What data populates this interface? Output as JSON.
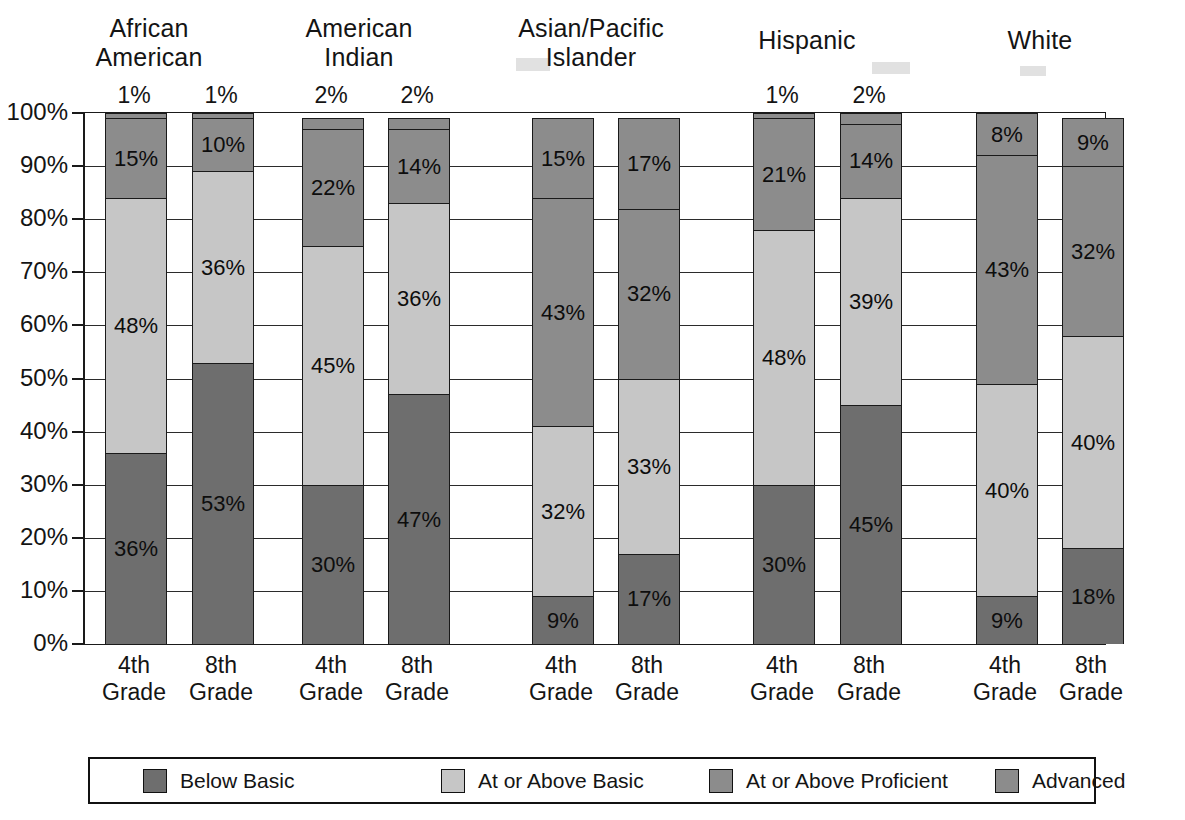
{
  "chart_data": {
    "type": "bar",
    "subtype": "stacked-column-100",
    "title": "",
    "xlabel": "",
    "ylabel": "",
    "ylim": [
      0,
      100
    ],
    "ytick_labels": [
      "100%",
      "90%",
      "80%",
      "70%",
      "60%",
      "50%",
      "40%",
      "30%",
      "20%",
      "10%",
      "0%"
    ],
    "ytick_values": [
      100,
      90,
      80,
      70,
      60,
      50,
      40,
      30,
      20,
      10,
      0
    ],
    "grid": true,
    "legend_position": "bottom",
    "legend": [
      "Below Basic",
      "At or Above Basic",
      "At or Above Proficient",
      "Advanced"
    ],
    "series_colors": [
      "#6e6e6e",
      "#c4c4c4",
      "#8f8f8f",
      "#8f8f8f"
    ],
    "groups": [
      "African American",
      "American Indian",
      "Asian/Pacific Islander",
      "Hispanic",
      "White"
    ],
    "categories": [
      "4th Grade",
      "8th Grade",
      "4th Grade",
      "8th Grade",
      "4th Grade",
      "8th Grade",
      "4th Grade",
      "8th Grade",
      "4th Grade",
      "8th Grade"
    ],
    "series": [
      {
        "name": "Below Basic",
        "values": [
          36,
          53,
          30,
          47,
          9,
          17,
          30,
          45,
          9,
          18
        ]
      },
      {
        "name": "At or Above Basic",
        "values": [
          48,
          36,
          45,
          36,
          32,
          33,
          48,
          39,
          40,
          40
        ]
      },
      {
        "name": "At or Above Proficient",
        "values": [
          15,
          10,
          22,
          14,
          43,
          32,
          21,
          14,
          43,
          32
        ]
      },
      {
        "name": "Advanced",
        "values": [
          1,
          1,
          2,
          2,
          1,
          1,
          1,
          2,
          1,
          1
        ]
      }
    ],
    "bar_labels": [
      {
        "below_basic": "36%",
        "at_or_above_basic": "48%",
        "at_or_above_proficient": "15%",
        "advanced": "1%"
      },
      {
        "below_basic": "53%",
        "at_or_above_basic": "36%",
        "at_or_above_proficient": "10%",
        "advanced": "1%"
      },
      {
        "below_basic": "30%",
        "at_or_above_basic": "45%",
        "at_or_above_proficient": "22%",
        "advanced": "2%"
      },
      {
        "below_basic": "47%",
        "at_or_above_basic": "36%",
        "at_or_above_proficient": "14%",
        "advanced": "2%"
      },
      {
        "below_basic": "9%",
        "at_or_above_basic": "32%",
        "at_or_above_proficient": "15%",
        "advanced": ""
      },
      {
        "below_basic": "17%",
        "at_or_above_basic": "33%",
        "at_or_above_proficient": "17%",
        "advanced": ""
      },
      {
        "below_basic": "30%",
        "at_or_above_basic": "48%",
        "at_or_above_proficient": "21%",
        "advanced": "1%"
      },
      {
        "below_basic": "45%",
        "at_or_above_basic": "39%",
        "at_or_above_proficient": "14%",
        "advanced": "2%"
      },
      {
        "below_basic": "9%",
        "at_or_above_basic": "40%",
        "at_or_above_proficient": "43%",
        "advanced": ""
      },
      {
        "below_basic": "18%",
        "at_or_above_basic": "40%",
        "at_or_above_proficient": "32%",
        "advanced": ""
      }
    ],
    "inner_labels_asian_pacific": {
      "bar1_proficient": "43%",
      "bar2_proficient": "32%"
    }
  },
  "groups": [
    {
      "label": "African\nAmerican"
    },
    {
      "label": "American\nIndian"
    },
    {
      "label": "Asian/Pacific\nIslander"
    },
    {
      "label": "Hispanic"
    },
    {
      "label": "White"
    }
  ],
  "yaxis": {
    "ticks": [
      {
        "label": "100%",
        "value": 100
      },
      {
        "label": "90%",
        "value": 90
      },
      {
        "label": "80%",
        "value": 80
      },
      {
        "label": "70%",
        "value": 70
      },
      {
        "label": "60%",
        "value": 60
      },
      {
        "label": "50%",
        "value": 50
      },
      {
        "label": "40%",
        "value": 40
      },
      {
        "label": "30%",
        "value": 30
      },
      {
        "label": "20%",
        "value": 20
      },
      {
        "label": "10%",
        "value": 10
      },
      {
        "label": "0%",
        "value": 0
      }
    ]
  },
  "xaxis": {
    "labels": [
      {
        "label": "4th\nGrade"
      },
      {
        "label": "8th\nGrade"
      },
      {
        "label": "4th\nGrade"
      },
      {
        "label": "8th\nGrade"
      },
      {
        "label": "4th\nGrade"
      },
      {
        "label": "8th\nGrade"
      },
      {
        "label": "4th\nGrade"
      },
      {
        "label": "8th\nGrade"
      },
      {
        "label": "4th\nGrade"
      },
      {
        "label": "8th\nGrade"
      }
    ]
  },
  "bars": [
    {
      "top_label": "1%",
      "segments": [
        {
          "key": "below_basic",
          "label": "36%",
          "value": 36,
          "color": "#6e6e6e"
        },
        {
          "key": "at_or_above_basic",
          "label": "48%",
          "value": 48,
          "color": "#c6c6c6"
        },
        {
          "key": "at_or_above_proficient",
          "label": "15%",
          "value": 15,
          "color": "#8c8c8c"
        },
        {
          "key": "advanced",
          "label": "",
          "value": 1,
          "color": "#8c8c8c"
        }
      ]
    },
    {
      "top_label": "1%",
      "segments": [
        {
          "key": "below_basic",
          "label": "53%",
          "value": 53,
          "color": "#6e6e6e"
        },
        {
          "key": "at_or_above_basic",
          "label": "36%",
          "value": 36,
          "color": "#c6c6c6"
        },
        {
          "key": "at_or_above_proficient",
          "label": "10%",
          "value": 10,
          "color": "#8c8c8c"
        },
        {
          "key": "advanced",
          "label": "",
          "value": 1,
          "color": "#8c8c8c"
        }
      ]
    },
    {
      "top_label": "2%",
      "segments": [
        {
          "key": "below_basic",
          "label": "30%",
          "value": 30,
          "color": "#6e6e6e"
        },
        {
          "key": "at_or_above_basic",
          "label": "45%",
          "value": 45,
          "color": "#c6c6c6"
        },
        {
          "key": "at_or_above_proficient",
          "label": "22%",
          "value": 22,
          "color": "#8c8c8c"
        },
        {
          "key": "advanced",
          "label": "",
          "value": 2,
          "color": "#8c8c8c"
        }
      ]
    },
    {
      "top_label": "2%",
      "segments": [
        {
          "key": "below_basic",
          "label": "47%",
          "value": 47,
          "color": "#6e6e6e"
        },
        {
          "key": "at_or_above_basic",
          "label": "36%",
          "value": 36,
          "color": "#c6c6c6"
        },
        {
          "key": "at_or_above_proficient",
          "label": "14%",
          "value": 14,
          "color": "#8c8c8c"
        },
        {
          "key": "advanced",
          "label": "",
          "value": 2,
          "color": "#8c8c8c"
        }
      ]
    },
    {
      "top_label": "",
      "segments": [
        {
          "key": "below_basic",
          "label": "9%",
          "value": 9,
          "color": "#6e6e6e"
        },
        {
          "key": "at_or_above_basic",
          "label": "32%",
          "value": 32,
          "color": "#c6c6c6"
        },
        {
          "key": "at_or_above_proficient",
          "label": "43%",
          "value": 43,
          "color": "#8c8c8c"
        },
        {
          "key": "advanced",
          "label": "15%",
          "value": 15,
          "color": "#8c8c8c"
        }
      ]
    },
    {
      "top_label": "",
      "segments": [
        {
          "key": "below_basic",
          "label": "17%",
          "value": 17,
          "color": "#6e6e6e"
        },
        {
          "key": "at_or_above_basic",
          "label": "33%",
          "value": 33,
          "color": "#c6c6c6"
        },
        {
          "key": "at_or_above_proficient",
          "label": "32%",
          "value": 32,
          "color": "#8c8c8c"
        },
        {
          "key": "advanced",
          "label": "17%",
          "value": 17,
          "color": "#8c8c8c"
        }
      ]
    },
    {
      "top_label": "1%",
      "segments": [
        {
          "key": "below_basic",
          "label": "30%",
          "value": 30,
          "color": "#6e6e6e"
        },
        {
          "key": "at_or_above_basic",
          "label": "48%",
          "value": 48,
          "color": "#c6c6c6"
        },
        {
          "key": "at_or_above_proficient",
          "label": "21%",
          "value": 21,
          "color": "#8c8c8c"
        },
        {
          "key": "advanced",
          "label": "",
          "value": 1,
          "color": "#8c8c8c"
        }
      ]
    },
    {
      "top_label": "2%",
      "segments": [
        {
          "key": "below_basic",
          "label": "45%",
          "value": 45,
          "color": "#6e6e6e"
        },
        {
          "key": "at_or_above_basic",
          "label": "39%",
          "value": 39,
          "color": "#c6c6c6"
        },
        {
          "key": "at_or_above_proficient",
          "label": "14%",
          "value": 14,
          "color": "#8c8c8c"
        },
        {
          "key": "advanced",
          "label": "",
          "value": 2,
          "color": "#8c8c8c"
        }
      ]
    },
    {
      "top_label": "",
      "segments": [
        {
          "key": "below_basic",
          "label": "9%",
          "value": 9,
          "color": "#6e6e6e"
        },
        {
          "key": "at_or_above_basic",
          "label": "40%",
          "value": 40,
          "color": "#c6c6c6"
        },
        {
          "key": "at_or_above_proficient",
          "label": "43%",
          "value": 43,
          "color": "#8c8c8c"
        },
        {
          "key": "advanced",
          "label": "8%",
          "value": 8,
          "color": "#8c8c8c"
        }
      ]
    },
    {
      "top_label": "",
      "segments": [
        {
          "key": "below_basic",
          "label": "18%",
          "value": 18,
          "color": "#6e6e6e"
        },
        {
          "key": "at_or_above_basic",
          "label": "40%",
          "value": 40,
          "color": "#c6c6c6"
        },
        {
          "key": "at_or_above_proficient",
          "label": "32%",
          "value": 32,
          "color": "#8c8c8c"
        },
        {
          "key": "advanced",
          "label": "9%",
          "value": 9,
          "color": "#8c8c8c"
        }
      ]
    }
  ],
  "legend": {
    "items": [
      {
        "label": "Below Basic",
        "color": "#6e6e6e"
      },
      {
        "label": "At or Above Basic",
        "color": "#c6c6c6"
      },
      {
        "label": "At or Above Proficient",
        "color": "#8c8c8c"
      },
      {
        "label": "Advanced",
        "color": "#8c8c8c"
      }
    ]
  }
}
